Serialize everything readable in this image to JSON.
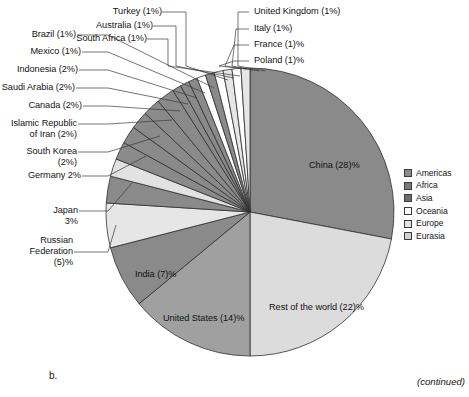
{
  "figure": {
    "panel_letter": "b.",
    "continued_note": "(continued)"
  },
  "legend": {
    "items": [
      {
        "label": "Americas",
        "color": "#8c8c8c"
      },
      {
        "label": "Africa",
        "color": "#7a7a7a"
      },
      {
        "label": "Asia",
        "color": "#6e6e6e"
      },
      {
        "label": "Oceania",
        "color": "#ffffff"
      },
      {
        "label": "Europe",
        "color": "#e2e2e2"
      },
      {
        "label": "Eurasia",
        "color": "#d2d2d2"
      }
    ]
  },
  "slice_labels": {
    "china": "China (28)%",
    "rest_of_world": "Rest of the world (22)%",
    "united_states": "United States (14)%",
    "india": "India (7)%"
  },
  "callouts": {
    "turkey": "Turkey (1%)",
    "australia": "Australia (1%)",
    "south_africa": "South Africa (1%)",
    "united_kingdom": "United Kingdom (1%)",
    "italy": "Italy (1%)",
    "france": "France (1)%",
    "poland": "Poland (1)%",
    "brazil": "Brazil (1%)",
    "mexico": "Mexico (1%)",
    "indonesia": "Indonesia (2%)",
    "saudi_arabia": "Saudi Arabia (2%)",
    "canada": "Canada (2%)",
    "iran": "Islamic Republic\nof Iran (2%)",
    "south_korea": "South Korea\n(2%)",
    "germany": "Germany 2%",
    "japan": "Japan\n3%",
    "russian_federation": "Russian\nFederation\n(5)%"
  },
  "chart_data": {
    "type": "pie",
    "title": "",
    "start_angle_deg": 0,
    "direction": "clockwise",
    "center": [
      250,
      212
    ],
    "radius": 144,
    "legend_position": "right",
    "categories": [
      "China",
      "Rest of the world",
      "United States",
      "India",
      "Russian Federation",
      "Japan",
      "Germany",
      "South Korea",
      "Islamic Republic of Iran",
      "Canada",
      "Saudi Arabia",
      "Indonesia",
      "Mexico",
      "Brazil",
      "South Africa",
      "Australia",
      "Turkey",
      "Poland",
      "France",
      "Italy",
      "United Kingdom"
    ],
    "values": [
      28,
      22,
      14,
      7,
      5,
      3,
      2,
      2,
      2,
      2,
      2,
      2,
      1,
      1,
      1,
      1,
      1,
      1,
      1,
      1,
      1
    ],
    "units": "percent",
    "groups": [
      "Asia",
      "Eurasia",
      "Americas",
      "Asia",
      "Eurasia",
      "Asia",
      "Europe",
      "Asia",
      "Asia",
      "Americas",
      "Asia",
      "Asia",
      "Americas",
      "Americas",
      "Africa",
      "Oceania",
      "Asia",
      "Europe",
      "Europe",
      "Europe",
      "Europe"
    ],
    "colors": [
      "#8a8a8a",
      "#dcdcdc",
      "#a0a0a0",
      "#8a8a8a",
      "#e6e6e6",
      "#8a8a8a",
      "#e2e2e2",
      "#8a8a8a",
      "#8a8a8a",
      "#8a8a8a",
      "#8a8a8a",
      "#8a8a8a",
      "#8a8a8a",
      "#8a8a8a",
      "#8a8a8a",
      "#ffffff",
      "#8a8a8a",
      "#ffffff",
      "#e6e6e6",
      "#ffffff",
      "#e6e6e6"
    ]
  }
}
